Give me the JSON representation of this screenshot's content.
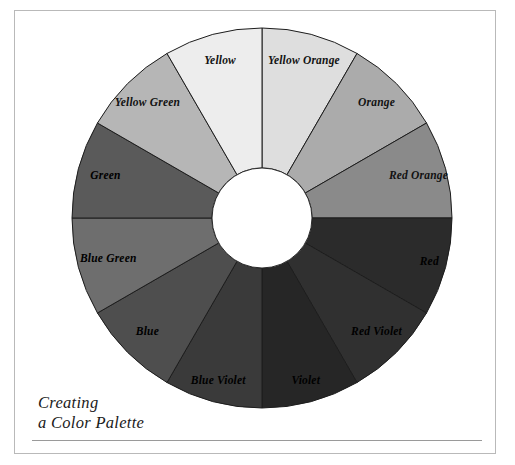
{
  "page": {
    "width": 515,
    "height": 465,
    "background": "#ffffff",
    "frame_color": "#b9b9b9"
  },
  "caption": {
    "line1": "Creating",
    "line2": "a Color Palette"
  },
  "wheel": {
    "center_x": 262,
    "center_y": 218,
    "outer_radius": 190,
    "inner_radius": 50,
    "segment_count": 12,
    "segment_degrees": 30,
    "start_angle_deg": -90,
    "stroke_color": "#1d1d1d",
    "hub_fill": "#ffffff"
  },
  "chart_data": {
    "type": "pie",
    "title": "Creating a Color Palette",
    "subtitle": "",
    "legend_position": "on-slices",
    "categories": [
      "Yellow Orange",
      "Orange",
      "Red Orange",
      "Red",
      "Red Violet",
      "Violet",
      "Blue Violet",
      "Blue",
      "Blue Green",
      "Green",
      "Yellow Green",
      "Yellow"
    ],
    "values": [
      30,
      30,
      30,
      30,
      30,
      30,
      30,
      30,
      30,
      30,
      30,
      30
    ],
    "colors": [
      "#dedede",
      "#ababab",
      "#8a8a8a",
      "#2b2b2b",
      "#303030",
      "#262626",
      "#3a3a3a",
      "#4e4e4e",
      "#6e6e6e",
      "#5a5a5a",
      "#b6b6b6",
      "#ededed"
    ],
    "xlabel": "",
    "ylabel": ""
  },
  "segments": [
    {
      "label": "Yellow Orange",
      "color": "#dedede",
      "start": -90,
      "end": -60,
      "label_contrast": "dark",
      "label_radius": 0.8
    },
    {
      "label": "Orange",
      "color": "#ababab",
      "start": -60,
      "end": -30,
      "label_contrast": "dark",
      "label_radius": 0.8
    },
    {
      "label": "Red Orange",
      "color": "#8a8a8a",
      "start": -30,
      "end": 0,
      "label_contrast": "dark",
      "label_radius": 0.8
    },
    {
      "label": "Red",
      "color": "#2b2b2b",
      "start": 0,
      "end": 30,
      "label_contrast": "light",
      "label_radius": 0.88
    },
    {
      "label": "Red Violet",
      "color": "#303030",
      "start": 30,
      "end": 60,
      "label_contrast": "light",
      "label_radius": 0.8
    },
    {
      "label": "Violet",
      "color": "#262626",
      "start": 60,
      "end": 90,
      "label_contrast": "light",
      "label_radius": 0.85
    },
    {
      "label": "Blue Violet",
      "color": "#3a3a3a",
      "start": 90,
      "end": 120,
      "label_contrast": "light",
      "label_radius": 0.85
    },
    {
      "label": "Blue",
      "color": "#4e4e4e",
      "start": 120,
      "end": 150,
      "label_contrast": "light",
      "label_radius": 0.8
    },
    {
      "label": "Blue Green",
      "color": "#6e6e6e",
      "start": 150,
      "end": 180,
      "label_contrast": "light",
      "label_radius": 0.78
    },
    {
      "label": "Green",
      "color": "#5a5a5a",
      "start": 180,
      "end": 210,
      "label_contrast": "light",
      "label_radius": 0.8
    },
    {
      "label": "Yellow Green",
      "color": "#b6b6b6",
      "start": 210,
      "end": 240,
      "label_contrast": "dark",
      "label_radius": 0.8
    },
    {
      "label": "Yellow",
      "color": "#ededed",
      "start": 240,
      "end": 270,
      "label_contrast": "dark",
      "label_radius": 0.8
    }
  ]
}
